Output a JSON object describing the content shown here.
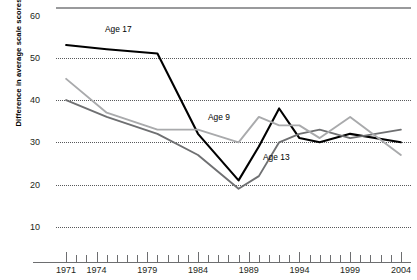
{
  "chart_data": {
    "type": "line",
    "title": "",
    "xlabel": "",
    "ylabel": "Difference in average scale scores",
    "xlim": [
      1970,
      2005
    ],
    "ylim": [
      5,
      62
    ],
    "grid": true,
    "legend_position": "inline-labels",
    "y_ticks": [
      60,
      50,
      40,
      30,
      20,
      10
    ],
    "x_ticks": [
      1971,
      1972,
      1973,
      1974,
      1975,
      1976,
      1977,
      1978,
      1979,
      1980,
      1981,
      1982,
      1983,
      1984,
      1985,
      1986,
      1987,
      1988,
      1989,
      1990,
      1991,
      1992,
      1993,
      1994,
      1995,
      1996,
      1997,
      1998,
      1999,
      2000,
      2001,
      2002,
      2003,
      2004
    ],
    "x_tick_labels": [
      "1971",
      "1974",
      "1979",
      "1984",
      "1989",
      "1994",
      "1999",
      "2004"
    ],
    "x_tick_label_years": [
      1971,
      1974,
      1979,
      1984,
      1989,
      1994,
      1999,
      2004
    ],
    "x": [
      1971,
      1975,
      1980,
      1984,
      1988,
      1990,
      1992,
      1994,
      1996,
      1999,
      2004
    ],
    "series": [
      {
        "name": "Age 17",
        "color": "#000000",
        "label": "Age 17",
        "values": [
          53,
          52,
          51,
          32,
          21,
          29,
          38,
          31,
          30,
          32,
          30
        ]
      },
      {
        "name": "Age 13",
        "color": "#6f7072",
        "label": "Age 13",
        "values": [
          40,
          36,
          32,
          27,
          19,
          22,
          30,
          32,
          33,
          31,
          33
        ]
      },
      {
        "name": "Age 9",
        "color": "#a9aaac",
        "label": "Age 9",
        "values": [
          45,
          37,
          33,
          33,
          30,
          36,
          34,
          34,
          31,
          36,
          27
        ]
      }
    ]
  },
  "axis": {
    "y_title": "Difference in average scale scores"
  },
  "labels": {
    "age17": "Age 17",
    "age13": "Age 13",
    "age9": "Age 9"
  }
}
